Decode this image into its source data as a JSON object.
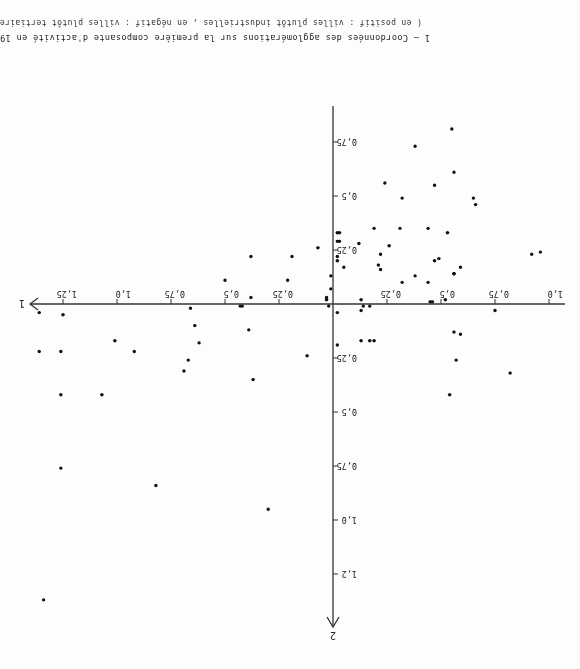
{
  "figure": {
    "title": "1 – Coordonnées des agglomérations sur la première composante d'activité en 1954",
    "subtitle": "( en positif : villes plutôt industrielles , en négatif : villes plutôt tertiaires )",
    "orientation": "rotated 180°"
  },
  "chart_data": {
    "type": "scatter",
    "title": "1 – Coordonnées des agglomérations sur la première composante d'activité en 1954",
    "subtitle": "(en positif : villes plutôt industrielles, en négatif : villes plutôt tertiaires)",
    "xlabel": "1",
    "ylabel": "2",
    "x_ticks": [
      "0,25",
      "0,5",
      "0,75",
      "1,0",
      "1,25"
    ],
    "x_ticks_negative": [
      "0,25",
      "0,5",
      "0,75",
      "1,0"
    ],
    "y_ticks": [
      "0,25",
      "0,5",
      "0,75",
      "1,0",
      "1,2"
    ],
    "y_ticks_negative": [
      "0,25",
      "0,5",
      "0,75"
    ],
    "xlim": [
      -1.0,
      1.4
    ],
    "ylim": [
      -0.95,
      1.5
    ],
    "grid": false,
    "legend": null,
    "points": [
      [
        1.36,
        0.04
      ],
      [
        1.25,
        0.05
      ],
      [
        1.36,
        0.22
      ],
      [
        1.26,
        0.22
      ],
      [
        1.01,
        0.17
      ],
      [
        0.92,
        0.22
      ],
      [
        1.26,
        0.42
      ],
      [
        1.07,
        0.42
      ],
      [
        1.26,
        0.76
      ],
      [
        0.82,
        0.84
      ],
      [
        0.66,
        0.02
      ],
      [
        0.64,
        0.1
      ],
      [
        0.62,
        0.18
      ],
      [
        0.67,
        0.26
      ],
      [
        0.69,
        0.31
      ],
      [
        0.43,
        0.01
      ],
      [
        0.42,
        0.01
      ],
      [
        0.39,
        0.12
      ],
      [
        0.37,
        0.35
      ],
      [
        0.12,
        0.24
      ],
      [
        0.3,
        0.95
      ],
      [
        0.02,
        0.01
      ],
      [
        -0.02,
        0.04
      ],
      [
        -0.02,
        0.19
      ],
      [
        -0.13,
        0.03
      ],
      [
        -0.14,
        0.01
      ],
      [
        -0.17,
        0.01
      ],
      [
        -0.13,
        0.17
      ],
      [
        -0.17,
        0.17
      ],
      [
        -0.19,
        0.17
      ],
      [
        -0.56,
        0.13
      ],
      [
        -0.59,
        0.14
      ],
      [
        -0.57,
        0.26
      ],
      [
        -0.75,
        0.03
      ],
      [
        -0.82,
        0.32
      ],
      [
        -0.54,
        0.42
      ],
      [
        1.34,
        1.37
      ],
      [
        0.5,
        -0.11
      ],
      [
        0.38,
        -0.22
      ],
      [
        0.21,
        -0.11
      ],
      [
        0.19,
        -0.22
      ],
      [
        0.07,
        -0.26
      ],
      [
        0.38,
        -0.03
      ],
      [
        0.03,
        -0.03
      ],
      [
        0.03,
        -0.02
      ],
      [
        0.01,
        -0.07
      ],
      [
        -0.02,
        -0.33
      ],
      [
        -0.03,
        -0.29
      ],
      [
        -0.02,
        -0.2
      ],
      [
        -0.02,
        -0.22
      ],
      [
        0.01,
        -0.13
      ],
      [
        -0.05,
        -0.17
      ],
      [
        -0.55,
        -0.81
      ],
      [
        -0.38,
        -0.73
      ],
      [
        -0.56,
        -0.61
      ],
      [
        -0.24,
        -0.56
      ],
      [
        -0.47,
        -0.55
      ],
      [
        -0.32,
        -0.49
      ],
      [
        -0.65,
        -0.49
      ],
      [
        -0.19,
        -0.35
      ],
      [
        -0.31,
        -0.35
      ],
      [
        -0.44,
        -0.35
      ],
      [
        -0.53,
        -0.33
      ],
      [
        -0.03,
        -0.33
      ],
      [
        -0.02,
        -0.29
      ],
      [
        -0.12,
        -0.28
      ],
      [
        -0.26,
        -0.27
      ],
      [
        -0.22,
        -0.23
      ],
      [
        -0.22,
        -0.16
      ],
      [
        -0.21,
        -0.18
      ],
      [
        -0.47,
        -0.2
      ],
      [
        -0.49,
        -0.21
      ],
      [
        -0.56,
        -0.14
      ],
      [
        -0.66,
        -0.46
      ],
      [
        -0.92,
        -0.23
      ],
      [
        -0.96,
        -0.24
      ],
      [
        -0.38,
        -0.13
      ],
      [
        -0.44,
        -0.1
      ],
      [
        -0.13,
        -0.02
      ],
      [
        -0.32,
        -0.1
      ],
      [
        -0.45,
        -0.01
      ],
      [
        -0.46,
        -0.01
      ],
      [
        -0.52,
        -0.02
      ],
      [
        -0.56,
        -0.14
      ],
      [
        -0.59,
        -0.17
      ]
    ]
  },
  "axes": {
    "origin_px": [
      247,
      365
    ],
    "px_per_unit": 216,
    "x_axis_from": 15,
    "x_axis_to": 550,
    "y_axis_from": 42,
    "y_axis_to": 563
  }
}
